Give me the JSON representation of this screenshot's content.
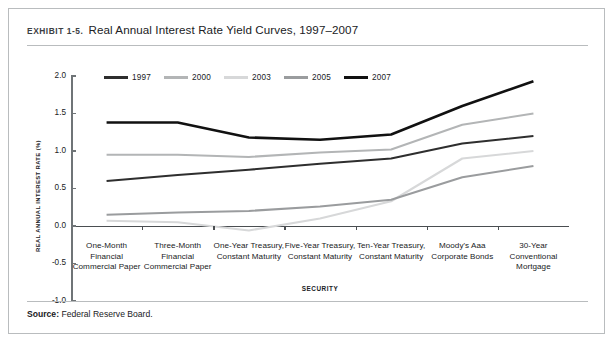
{
  "exhibit": {
    "label": "EXHIBIT 1-5.",
    "title": "Real Annual Interest Rate Yield Curves, 1997–2007"
  },
  "source": {
    "label": "Source:",
    "text": "Federal Reserve Board."
  },
  "chart_data": {
    "type": "line",
    "title": "Real Annual Interest Rate Yield Curves, 1997–2007",
    "xlabel": "SECURITY",
    "ylabel": "REAL ANNUAL INTEREST RATE (%)",
    "ylim": [
      -1.0,
      2.0
    ],
    "yticks": [
      2.0,
      1.5,
      1.0,
      0.5,
      0.0,
      -0.5,
      -1.0
    ],
    "ytick_labels": [
      "2.0",
      "1.5",
      "1.0",
      "0.5",
      "0.0",
      "-0.5",
      "-1.0"
    ],
    "grid": false,
    "legend_position": "top-left",
    "categories": [
      "One-Month Financial Commercial Paper",
      "Three-Month Financial Commercial Paper",
      "One-Year Treasury, Constant Maturity",
      "Five-Year Treasury, Constant Maturity",
      "Ten-Year Treasury, Constant Maturity",
      "Moody's Aaa Corporate Bonds",
      "30-Year Conventional Mortgage"
    ],
    "category_lines": [
      [
        "One-Month",
        "Financial",
        "Commercial Paper"
      ],
      [
        "Three-Month",
        "Financial",
        "Commercial Paper"
      ],
      [
        "One-Year Treasury,",
        "Constant Maturity"
      ],
      [
        "Five-Year Treasury,",
        "Constant Maturity"
      ],
      [
        "Ten-Year Treasury,",
        "Constant Maturity"
      ],
      [
        "Moody's Aaa",
        "Corporate Bonds"
      ],
      [
        "30-Year",
        "Conventional",
        "Mortgage"
      ]
    ],
    "series": [
      {
        "name": "1997",
        "color": "#2e2e2e",
        "width": 2.1,
        "values": [
          0.6,
          0.68,
          0.75,
          0.83,
          0.9,
          1.1,
          1.2
        ]
      },
      {
        "name": "2000",
        "color": "#b3b5b6",
        "width": 2.1,
        "values": [
          0.95,
          0.95,
          0.92,
          0.98,
          1.02,
          1.35,
          1.5
        ]
      },
      {
        "name": "2003",
        "color": "#d7d8d9",
        "width": 2.1,
        "values": [
          0.07,
          0.05,
          -0.06,
          0.1,
          0.33,
          0.9,
          1.0
        ]
      },
      {
        "name": "2005",
        "color": "#9a9c9e",
        "width": 2.1,
        "values": [
          0.15,
          0.18,
          0.2,
          0.26,
          0.35,
          0.65,
          0.8
        ]
      },
      {
        "name": "2007",
        "color": "#111111",
        "width": 2.6,
        "values": [
          1.38,
          1.38,
          1.18,
          1.15,
          1.22,
          1.6,
          1.93
        ]
      }
    ]
  }
}
